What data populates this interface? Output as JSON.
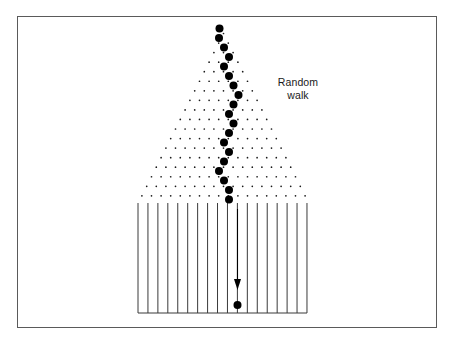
{
  "figure": {
    "background_color": "#ffffff",
    "border_color": "#5a5a5a",
    "ink_color": "#000000",
    "border": {
      "x": 17,
      "y": 16,
      "width": 420,
      "height": 312
    }
  },
  "caption": {
    "text": "Random\nwalk",
    "line1": "Random",
    "line2": "walk",
    "x": 266,
    "y": 76,
    "font_size": 10.5,
    "align": "center"
  },
  "lattice": {
    "description": "Triangular array of small dots; row r has r+1 sites, apex at top, widening downward",
    "apex": {
      "x": 223.5,
      "y": 33.5
    },
    "dx": 9.6,
    "dy": 9.55,
    "rows": 18,
    "dot_radius": 0.85,
    "dot_color": "#1a1a1a",
    "row_counts": [
      1,
      2,
      3,
      4,
      5,
      6,
      7,
      8,
      9,
      10,
      11,
      12,
      13,
      14,
      15,
      16,
      17,
      18
    ]
  },
  "walk": {
    "description": "Large filled dots tracing one realization of the random walk down the lattice",
    "dot_radius": 4.0,
    "dot_color": "#000000",
    "steps": [
      {
        "step": 0,
        "row": 0,
        "offset": 0,
        "x": 219.5,
        "y": 28.5
      },
      {
        "step": 1,
        "row": 1,
        "offset": -1,
        "x": 219.0,
        "y": 38.0
      },
      {
        "step": 2,
        "row": 2,
        "offset": 0,
        "x": 224.0,
        "y": 47.5
      },
      {
        "step": 3,
        "row": 3,
        "offset": 1,
        "x": 229.0,
        "y": 57.0
      },
      {
        "step": 4,
        "row": 4,
        "offset": 0,
        "x": 224.0,
        "y": 66.5
      },
      {
        "step": 5,
        "row": 5,
        "offset": 1,
        "x": 229.0,
        "y": 76.0
      },
      {
        "step": 6,
        "row": 6,
        "offset": 2,
        "x": 233.5,
        "y": 85.5
      },
      {
        "step": 7,
        "row": 7,
        "offset": 3,
        "x": 238.5,
        "y": 95.0
      },
      {
        "step": 8,
        "row": 8,
        "offset": 2,
        "x": 233.5,
        "y": 104.5
      },
      {
        "step": 9,
        "row": 9,
        "offset": 1,
        "x": 229.0,
        "y": 114.0
      },
      {
        "step": 10,
        "row": 10,
        "offset": 2,
        "x": 233.5,
        "y": 123.5
      },
      {
        "step": 11,
        "row": 11,
        "offset": 1,
        "x": 229.0,
        "y": 133.0
      },
      {
        "step": 12,
        "row": 12,
        "offset": 0,
        "x": 224.0,
        "y": 142.5
      },
      {
        "step": 13,
        "row": 13,
        "offset": 1,
        "x": 229.0,
        "y": 152.0
      },
      {
        "step": 14,
        "row": 14,
        "offset": 0,
        "x": 224.0,
        "y": 161.5
      },
      {
        "step": 15,
        "row": 15,
        "offset": -1,
        "x": 219.0,
        "y": 171.0
      },
      {
        "step": 16,
        "row": 16,
        "offset": 0,
        "x": 224.0,
        "y": 180.5
      },
      {
        "step": 17,
        "row": 17,
        "offset": 1,
        "x": 229.0,
        "y": 190.0
      },
      {
        "step": 18,
        "row": 18,
        "offset": 1,
        "x": 229.0,
        "y": 199.5
      }
    ],
    "final_dot": {
      "x": 237.5,
      "y": 305.0,
      "radius": 4.0
    }
  },
  "bins": {
    "description": "Array of equally spaced vertical lines forming collection bins below the lattice",
    "count": 18,
    "x_start": 138.0,
    "x_end": 307.0,
    "spacing": 9.94,
    "y_top": 203.0,
    "y_bottom": 313.0,
    "line_color": "#3a3a3a",
    "line_width": 1.0,
    "baseline": {
      "x1": 138.0,
      "x2": 307.0,
      "y": 313.0
    }
  },
  "arrow": {
    "description": "Downward arrow showing the particle falling into its bin",
    "x": 237.5,
    "y_start": 209.0,
    "y_end": 290.0,
    "head_width": 7.0,
    "head_length": 11.0,
    "color": "#000000",
    "line_width": 1.1
  }
}
